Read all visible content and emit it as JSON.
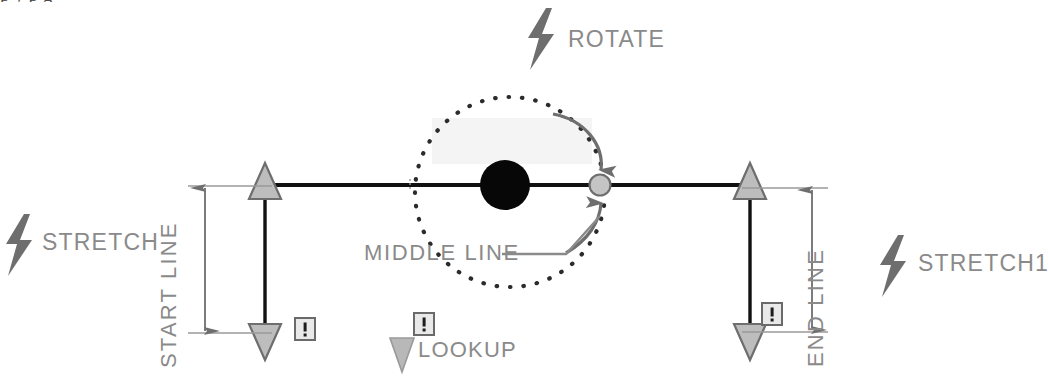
{
  "figure": {
    "background_color": "#ffffff",
    "label_color": "#8a8a8a",
    "line_color": "#111111",
    "grip_color": "#b0b0b0",
    "accent_grey": "#808080"
  },
  "clipped_heading": {
    "text": "p y   p              g"
  },
  "labels": {
    "rotate": "ROTATE",
    "stretch": "STRETCH",
    "stretch1": "STRETCH1",
    "lookup": "LOOKUP",
    "middle_line": "MIDDLE LINE",
    "start_line": "START  LINE",
    "end_line": "END  LINE"
  },
  "icons": {
    "rotate": "lightning-bolt-icon",
    "stretch": "lightning-bolt-icon",
    "stretch1": "lightning-bolt-icon",
    "lookup": "triangle-down-icon",
    "alert": "alert-exclamation-icon"
  },
  "geometry": {
    "baseline_y": 185,
    "baseline_x_start": 265,
    "baseline_x_end": 750,
    "base_point_x": 505,
    "base_point_radius": 25,
    "rotation_grip_x": 600,
    "rotation_grip_radius": 10,
    "dotted_circle_cx": 510,
    "dotted_circle_cy": 192,
    "dotted_circle_r": 95
  },
  "markers": {
    "alert_badges": [
      {
        "name": "alert-badge-left",
        "x": 295,
        "y": 328
      },
      {
        "name": "alert-badge-center",
        "x": 422,
        "y": 323
      },
      {
        "name": "alert-badge-right",
        "x": 770,
        "y": 313
      }
    ]
  },
  "dimensions": [
    {
      "name": "start-line-dimension",
      "label": "START  LINE",
      "x": 205,
      "y_top": 188,
      "y_bottom": 332
    },
    {
      "name": "end-line-dimension",
      "label": "END  LINE",
      "x": 812,
      "y_top": 190,
      "y_bottom": 330
    }
  ],
  "stretch_grips": [
    {
      "name": "stretch-grip-left",
      "x": 265,
      "y_top": 185,
      "y_bottom": 338
    },
    {
      "name": "stretch-grip-right",
      "x": 750,
      "y_top": 185,
      "y_bottom": 338
    }
  ]
}
